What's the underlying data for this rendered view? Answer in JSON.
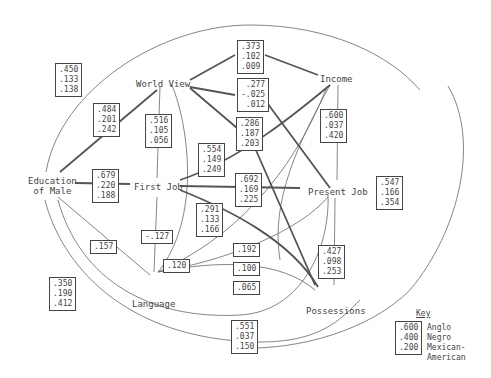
{
  "nodes": {
    "education_of_male": [
      "Education",
      "of Male"
    ],
    "world_view": "World View",
    "first_job": "First Job",
    "income": "Income",
    "present_job": "Present Job",
    "language": "Language",
    "possessions": "Possessions"
  },
  "coefficients": {
    "edu_income": [
      ".450",
      ".133",
      ".138"
    ],
    "edu_worldview": [
      ".484",
      ".201",
      ".242"
    ],
    "worldview_firstjob": [
      ".516",
      ".105",
      ".056"
    ],
    "worldview_income": [
      ".373",
      ".102",
      ".009"
    ],
    "worldview_presentjob": [
      ".277",
      "-.025",
      ".012"
    ],
    "worldview_possessions": [
      ".286",
      ".187",
      ".203"
    ],
    "firstjob_income": [
      ".554",
      ".149",
      ".249"
    ],
    "edu_firstjob": [
      ".679",
      ".220",
      ".188"
    ],
    "firstjob_presentjob": [
      ".692",
      ".169",
      ".225"
    ],
    "firstjob_possessions": [
      ".291",
      ".133",
      ".166"
    ],
    "income_presentjob": [
      ".600",
      ".037",
      ".420"
    ],
    "income_possessions": [
      ".547",
      ".166",
      ".354"
    ],
    "presentjob_possessions": [
      ".427",
      ".098",
      ".253"
    ],
    "edu_language": [
      ".157"
    ],
    "firstjob_language": [
      "-.127"
    ],
    "worldview_language": [
      ".120"
    ],
    "language_income": [
      ".192"
    ],
    "language_presentjob": [
      ".100"
    ],
    "language_possessions": [
      ".065"
    ],
    "edu_presentjob": [
      ".551",
      ".037",
      ".150"
    ],
    "edu_possessions": [
      ".350",
      ".190",
      ".412"
    ]
  },
  "key": {
    "title": "Key",
    "values": [
      ".600",
      ".400",
      ".200"
    ],
    "labels": [
      "Anglo",
      "Negro",
      "Mexican-",
      "American"
    ]
  }
}
